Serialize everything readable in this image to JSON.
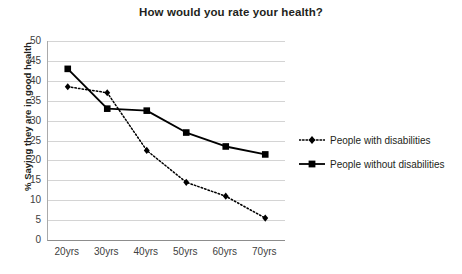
{
  "chart_data": {
    "type": "line",
    "title": "How would you rate your health?",
    "xlabel": "",
    "ylabel": "% Saying they are in good health",
    "categories": [
      "20yrs",
      "30yrs",
      "40yrs",
      "50yrs",
      "60yrs",
      "70yrs"
    ],
    "ylim": [
      0,
      50
    ],
    "yticks": [
      0,
      5,
      10,
      15,
      20,
      25,
      30,
      35,
      40,
      45,
      50
    ],
    "ytick_labels": [
      "0",
      "5",
      "10",
      "15",
      "20",
      "25",
      "30",
      "35",
      "40",
      "45",
      "50"
    ],
    "grid": "horizontal",
    "legend_position": "right",
    "series": [
      {
        "name": "People with disabilities",
        "values": [
          38.5,
          37,
          22.5,
          14.5,
          11,
          5.5
        ],
        "line_style": "dotted",
        "marker": "diamond",
        "color": "#000000"
      },
      {
        "name": "People without disabilities",
        "values": [
          43,
          33,
          32.5,
          27,
          23.5,
          21.5
        ],
        "line_style": "solid",
        "marker": "square",
        "color": "#000000"
      }
    ]
  },
  "legend": {
    "items": [
      {
        "label": "People with disabilities",
        "style": "dotted-diamond"
      },
      {
        "label": "People without disabilities",
        "style": "solid-square"
      }
    ]
  },
  "colors": {
    "line": "#000000",
    "grid": "#d4d4d4",
    "axis": "#8d8d8d",
    "text": "#231f20",
    "tick_text": "#404040",
    "background": "#ffffff"
  }
}
